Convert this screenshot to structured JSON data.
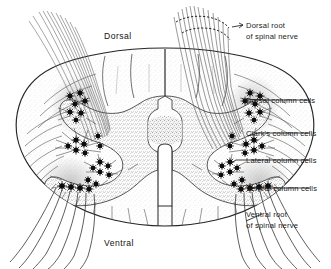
{
  "figure": {
    "type": "anatomical-line-diagram",
    "orientation_labels": {
      "dorsal": "Dorsal",
      "ventral": "Ventral"
    },
    "callout_labels": [
      {
        "id": "dorsal-root",
        "line1": "Dorsal root",
        "line2": "of spinal nerve"
      },
      {
        "id": "dorsal-column-cells",
        "line1": "Dorsal column cells",
        "line2": ""
      },
      {
        "id": "clarks-column-cells",
        "line1": "Clark's column cells",
        "line2": ""
      },
      {
        "id": "lateral-column-cells",
        "line1": "Lateral column cells",
        "line2": ""
      },
      {
        "id": "ventral-column-cells",
        "line1": "Ventral column cells",
        "line2": ""
      },
      {
        "id": "ventral-root",
        "line1": "Ventral root",
        "line2": "of spinal nerve"
      }
    ],
    "colors": {
      "background": "#ffffff",
      "ink": "#1a1a1a",
      "outline": "#222222",
      "gray_matter_stipple": "#9a9a9a",
      "white_matter_stipple": "#c8c8c8",
      "cell_body": "#101010",
      "nerve_fiber": "#555555"
    },
    "structures": [
      "white matter (peripheral, stippled, radiating septa)",
      "gray matter (central butterfly / H-shape)",
      "central canal (vertical slot)",
      "dorsal median septum",
      "ventral median fissure",
      "dorsal horns (posterior)",
      "ventral horns (anterior)",
      "dorsal root fiber bundles (bilateral, entering dorsolaterally)",
      "ventral root fiber bundles (bilateral, exiting ventrolaterally)"
    ],
    "cell_clusters": [
      {
        "name": "dorsal column cells",
        "side": "left"
      },
      {
        "name": "dorsal column cells",
        "side": "right"
      },
      {
        "name": "clark's column cells",
        "side": "left"
      },
      {
        "name": "clark's column cells",
        "side": "right"
      },
      {
        "name": "lateral column cells",
        "side": "left"
      },
      {
        "name": "lateral column cells",
        "side": "right"
      },
      {
        "name": "ventral column cells",
        "side": "left"
      },
      {
        "name": "ventral column cells",
        "side": "right"
      }
    ]
  }
}
